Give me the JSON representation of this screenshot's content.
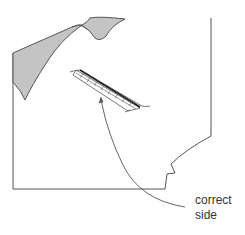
{
  "diagram": {
    "annotation": {
      "line1": "correct",
      "line2": "side"
    },
    "colors": {
      "stroke": "#555555",
      "fill_shaded": "#c4c4c4",
      "background": "#ffffff"
    }
  }
}
